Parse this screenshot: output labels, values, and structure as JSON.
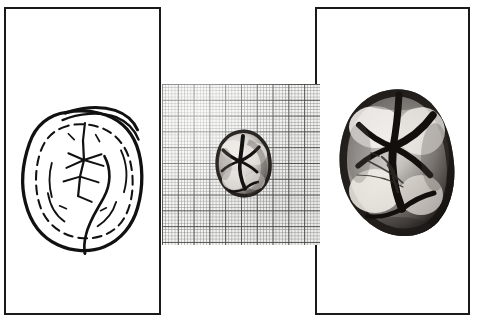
{
  "figure": {
    "background_color": "#ffffff",
    "width_px": 478,
    "height_px": 322,
    "panel_count": 3,
    "frame_color": "#1a1a1a",
    "caption": ""
  },
  "panels": [
    {
      "id": "a",
      "label": "",
      "kind": "line-drawing",
      "description": "Schematic interpretive line drawing of the occlusal surface of a molar, showing crown outline, cusp boundaries and the fissure (groove) pattern.",
      "subject": "molar occlusal surface",
      "x": 4,
      "y": 7,
      "width": 157,
      "height": 308,
      "frame": true,
      "stroke_color": "#111111",
      "fill_color": "#ffffff"
    },
    {
      "id": "b",
      "label": "",
      "kind": "scale-photograph",
      "description": "Photograph of the molar crown resting on millimetre graph paper, giving the natural size of the specimen.",
      "subject": "molar on millimetre graph paper",
      "x": 162,
      "y": 84,
      "width": 158,
      "height": 161,
      "frame": false,
      "grid": {
        "minor_cell_px": 3.16,
        "major_cell_px": 15.8,
        "minor_per_major": 5,
        "minor_line_color": "#828282",
        "major_line_color": "#464646",
        "paper_color": "#f5f5f3",
        "unit": "mm"
      },
      "specimen": {
        "x": 50,
        "y": 44,
        "width": 62,
        "height": 72,
        "approx_mesiodistal_mm": 12,
        "approx_buccolingual_mm": 14
      }
    },
    {
      "id": "c",
      "label": "",
      "kind": "photograph",
      "description": "Magnified greyscale photograph of the same molar occlusal surface; dark fissures separate the light, worn cusps.",
      "subject": "magnified molar occlusal surface",
      "x": 315,
      "y": 7,
      "width": 155,
      "height": 308,
      "frame": true,
      "specimen": {
        "x": 18,
        "y": 78,
        "width": 122,
        "height": 152
      }
    }
  ],
  "anatomy": {
    "features": [
      "crown outline",
      "cusp boundaries",
      "principal fissure pattern",
      "occlusal wear facets",
      "enamel margin"
    ]
  },
  "icons": {
    "panel_frame": "rectangle-frame",
    "grid": "grid-icon"
  }
}
